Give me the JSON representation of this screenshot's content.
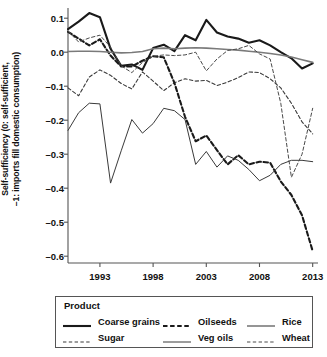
{
  "chart_data": {
    "type": "line",
    "title": "",
    "xlabel": "",
    "ylabel": "Self-sufficiency (0: self-sufficient,\n–1: imports fill domestic consumption)",
    "ylabel_line1": "Self-sufficiency (0: self-sufficient,",
    "ylabel_line2": "–1: imports fill domestic consumption)",
    "xlim": [
      1990,
      2013.5
    ],
    "ylim": [
      -0.62,
      0.13
    ],
    "grid": false,
    "legend_position": "below-plot",
    "legend_title": "Product",
    "yticks": [
      0.1,
      0.0,
      -0.1,
      -0.2,
      -0.3,
      -0.4,
      -0.5,
      -0.6
    ],
    "ytick_labels": [
      "0.1",
      "0.0",
      "–0.1",
      "–0.2",
      "–0.3",
      "–0.4",
      "–0.5",
      "–0.6"
    ],
    "xticks": [
      1993,
      1998,
      2003,
      2008,
      2013
    ],
    "xtick_labels": [
      "1993",
      "1998",
      "2003",
      "2008",
      "2013"
    ],
    "x": [
      1990,
      1991,
      1992,
      1993,
      1994,
      1995,
      1996,
      1997,
      1998,
      1999,
      2000,
      2001,
      2002,
      2003,
      2004,
      2005,
      2006,
      2007,
      2008,
      2009,
      2010,
      2011,
      2012,
      2013
    ],
    "series": [
      {
        "name": "Coarse grains",
        "style": "solid",
        "width": 2.1,
        "color": "#1a1a1a",
        "values": [
          0.068,
          0.09,
          0.115,
          0.103,
          0.01,
          -0.04,
          -0.036,
          -0.052,
          0.012,
          0.022,
          0.003,
          0.05,
          0.035,
          0.095,
          0.058,
          0.046,
          0.04,
          0.028,
          0.035,
          0.02,
          0.0,
          -0.018,
          -0.048,
          -0.033
        ]
      },
      {
        "name": "Sugar",
        "style": "dashed",
        "width": 1.1,
        "color": "#3a3a3a",
        "values": [
          -0.105,
          -0.128,
          -0.073,
          -0.052,
          -0.068,
          -0.092,
          -0.108,
          -0.058,
          -0.085,
          -0.113,
          -0.09,
          -0.078,
          -0.085,
          -0.083,
          -0.098,
          -0.088,
          -0.075,
          -0.058,
          -0.06,
          -0.078,
          -0.105,
          -0.15,
          -0.205,
          -0.24
        ]
      },
      {
        "name": "Oilseeds",
        "style": "dashed",
        "width": 2.1,
        "color": "#1a1a1a",
        "values": [
          0.06,
          0.04,
          0.02,
          0.038,
          -0.01,
          -0.042,
          -0.042,
          -0.025,
          -0.012,
          -0.015,
          -0.09,
          -0.19,
          -0.262,
          -0.245,
          -0.288,
          -0.33,
          -0.303,
          -0.33,
          -0.322,
          -0.325,
          -0.38,
          -0.42,
          -0.48,
          -0.585
        ]
      },
      {
        "name": "Veg oils",
        "style": "solid",
        "width": 1.0,
        "color": "#3a3a3a",
        "values": [
          -0.23,
          -0.178,
          -0.15,
          -0.152,
          -0.385,
          -0.29,
          -0.198,
          -0.238,
          -0.21,
          -0.165,
          -0.172,
          -0.198,
          -0.33,
          -0.292,
          -0.338,
          -0.305,
          -0.318,
          -0.345,
          -0.378,
          -0.362,
          -0.33,
          -0.318,
          -0.318,
          -0.322
        ]
      },
      {
        "name": "Rice",
        "style": "solid",
        "width": 1.6,
        "color": "#7a7a7a",
        "values": [
          0.002,
          0.003,
          0.003,
          0.002,
          0.0,
          -0.002,
          -0.001,
          0.002,
          0.01,
          0.012,
          0.01,
          0.012,
          0.013,
          0.012,
          0.01,
          0.008,
          0.006,
          0.003,
          0.0,
          -0.004,
          -0.008,
          -0.014,
          -0.022,
          -0.03
        ]
      },
      {
        "name": "Wheat",
        "style": "dashed",
        "width": 1.0,
        "color": "#4a4a4a",
        "values": [
          0.062,
          0.03,
          0.042,
          0.05,
          0.015,
          -0.04,
          -0.06,
          -0.03,
          -0.012,
          -0.008,
          -0.01,
          -0.008,
          0.0,
          -0.055,
          -0.02,
          0.005,
          0.01,
          0.02,
          -0.005,
          -0.02,
          -0.15,
          -0.368,
          -0.3,
          -0.165
        ]
      }
    ],
    "legend_entries": [
      {
        "label": "Coarse grains",
        "style": "solid",
        "width": 2.1,
        "color": "#1a1a1a"
      },
      {
        "label": "Oilseeds",
        "style": "dashed",
        "width": 2.1,
        "color": "#1a1a1a"
      },
      {
        "label": "Rice",
        "style": "solid",
        "width": 1.6,
        "color": "#7a7a7a"
      },
      {
        "label": "Sugar",
        "style": "dashed",
        "width": 1.1,
        "color": "#3a3a3a"
      },
      {
        "label": "Veg oils",
        "style": "solid",
        "width": 1.0,
        "color": "#3a3a3a"
      },
      {
        "label": "Wheat",
        "style": "dashed",
        "width": 1.0,
        "color": "#4a4a4a"
      }
    ]
  }
}
